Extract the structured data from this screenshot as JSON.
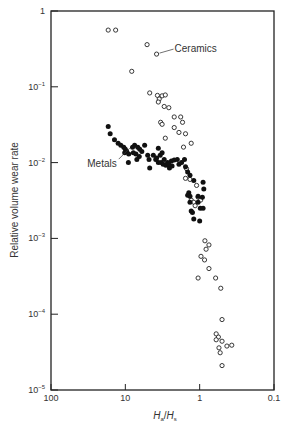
{
  "chart_data": {
    "type": "scatter",
    "title": "",
    "xlabel": "Ha/Hs",
    "xlabel_main": "H",
    "xlabel_sub_a": "a",
    "xlabel_sub_s": "s",
    "ylabel": "Relative volume wear rate",
    "xscale": "log",
    "yscale": "log",
    "x_reversed": true,
    "xlim": [
      100,
      0.1
    ],
    "ylim": [
      1e-05,
      1
    ],
    "grid": false,
    "legend": "none (direct annotations)",
    "x_ticks": [
      {
        "value": 100,
        "label": "100"
      },
      {
        "value": 10,
        "label": "10"
      },
      {
        "value": 1,
        "label": "1"
      },
      {
        "value": 0.1,
        "label": "0.1"
      }
    ],
    "y_ticks": [
      {
        "value": 1,
        "base": "1",
        "exp": ""
      },
      {
        "value": 0.1,
        "base": "10",
        "exp": "−1"
      },
      {
        "value": 0.01,
        "base": "10",
        "exp": "−2"
      },
      {
        "value": 0.001,
        "base": "10",
        "exp": "−3"
      },
      {
        "value": 0.0001,
        "base": "10",
        "exp": "−4"
      },
      {
        "value": 1e-05,
        "base": "10",
        "exp": "−5"
      }
    ],
    "annotations": [
      {
        "text": "Ceramics",
        "x": 3.8,
        "y": 0.27,
        "series": "Ceramics"
      },
      {
        "text": "Metals",
        "x": 9.0,
        "y": 0.016,
        "series": "Metals"
      }
    ],
    "series": [
      {
        "name": "Ceramics",
        "marker": "open-circle",
        "color": "#222222",
        "points": [
          [
            17.0,
            0.56
          ],
          [
            13.5,
            0.56
          ],
          [
            5.1,
            0.36
          ],
          [
            8.2,
            0.16
          ],
          [
            3.8,
            0.27
          ],
          [
            4.7,
            0.083
          ],
          [
            3.7,
            0.077
          ],
          [
            3.5,
            0.069
          ],
          [
            3.2,
            0.076
          ],
          [
            2.9,
            0.078
          ],
          [
            3.6,
            0.063
          ],
          [
            3.0,
            0.055
          ],
          [
            2.6,
            0.053
          ],
          [
            2.2,
            0.04
          ],
          [
            1.8,
            0.04
          ],
          [
            2.2,
            0.029
          ],
          [
            1.7,
            0.034
          ],
          [
            1.9,
            0.025
          ],
          [
            1.55,
            0.024
          ],
          [
            3.35,
            0.034
          ],
          [
            3.2,
            0.032
          ],
          [
            2.9,
            0.021
          ],
          [
            1.65,
            0.016
          ],
          [
            1.3,
            0.018
          ],
          [
            1.5,
            0.0083
          ],
          [
            1.55,
            0.0062
          ],
          [
            1.35,
            0.006
          ],
          [
            1.1,
            0.005
          ],
          [
            1.3,
            0.0032
          ],
          [
            1.2,
            0.003
          ],
          [
            1.15,
            0.0027
          ],
          [
            1.05,
            0.0035
          ],
          [
            0.97,
            0.0032
          ],
          [
            0.85,
            0.00093
          ],
          [
            0.75,
            0.00082
          ],
          [
            0.82,
            0.00072
          ],
          [
            0.96,
            0.00058
          ],
          [
            0.86,
            0.00052
          ],
          [
            0.75,
            0.0004
          ],
          [
            1.05,
            0.0003
          ],
          [
            0.61,
            0.0003
          ],
          [
            0.52,
            0.00022
          ],
          [
            0.5,
            8.5e-05
          ],
          [
            0.56,
            5e-05
          ],
          [
            0.6,
            5.5e-05
          ],
          [
            0.6,
            4.6e-05
          ],
          [
            0.5,
            4.4e-05
          ],
          [
            0.43,
            3.8e-05
          ],
          [
            0.37,
            3.9e-05
          ],
          [
            0.55,
            3.6e-05
          ],
          [
            0.53,
            3.1e-05
          ],
          [
            0.5,
            2.1e-05
          ]
        ]
      },
      {
        "name": "Metals",
        "marker": "filled-circle",
        "color": "#111111",
        "points": [
          [
            17.0,
            0.03
          ],
          [
            16.0,
            0.024
          ],
          [
            14.0,
            0.02
          ],
          [
            12.5,
            0.018
          ],
          [
            11.5,
            0.017
          ],
          [
            10.5,
            0.016
          ],
          [
            10.0,
            0.015
          ],
          [
            9.6,
            0.014
          ],
          [
            10.2,
            0.0135
          ],
          [
            9.0,
            0.013
          ],
          [
            7.2,
            0.013
          ],
          [
            6.0,
            0.014
          ],
          [
            5.0,
            0.0125
          ],
          [
            4.8,
            0.011
          ],
          [
            5.5,
            0.017
          ],
          [
            7.5,
            0.017
          ],
          [
            6.8,
            0.016
          ],
          [
            6.4,
            0.015
          ],
          [
            8.0,
            0.016
          ],
          [
            7.8,
            0.0135
          ],
          [
            6.5,
            0.012
          ],
          [
            7.0,
            0.011
          ],
          [
            9.1,
            0.01
          ],
          [
            4.2,
            0.0125
          ],
          [
            3.9,
            0.011
          ],
          [
            3.6,
            0.01
          ],
          [
            3.3,
            0.01
          ],
          [
            3.1,
            0.0095
          ],
          [
            3.8,
            0.0115
          ],
          [
            3.4,
            0.0125
          ],
          [
            3.0,
            0.011
          ],
          [
            2.7,
            0.01
          ],
          [
            2.4,
            0.0105
          ],
          [
            2.2,
            0.0108
          ],
          [
            2.0,
            0.011
          ],
          [
            3.6,
            0.0155
          ],
          [
            3.2,
            0.0135
          ],
          [
            4.7,
            0.0085
          ],
          [
            2.85,
            0.0092
          ],
          [
            2.35,
            0.009
          ],
          [
            2.55,
            0.0085
          ],
          [
            2.6,
            0.0095
          ],
          [
            1.9,
            0.0095
          ],
          [
            1.75,
            0.01
          ],
          [
            1.6,
            0.011
          ],
          [
            1.55,
            0.0088
          ],
          [
            1.45,
            0.0075
          ],
          [
            1.35,
            0.0068
          ],
          [
            1.2,
            0.0058
          ],
          [
            0.9,
            0.0055
          ],
          [
            0.88,
            0.0045
          ],
          [
            0.92,
            0.0035
          ],
          [
            1.05,
            0.0036
          ],
          [
            1.05,
            0.003
          ],
          [
            0.98,
            0.0025
          ],
          [
            0.9,
            0.0025
          ],
          [
            1.35,
            0.003
          ],
          [
            1.25,
            0.0022
          ],
          [
            1.3,
            0.0023
          ],
          [
            1.2,
            0.0018
          ],
          [
            1.0,
            0.0017
          ],
          [
            1.4,
            0.004
          ],
          [
            1.45,
            0.0037
          ],
          [
            1.35,
            0.0036
          ]
        ]
      }
    ]
  },
  "layout_px": {
    "plot_left": 51,
    "plot_right": 274,
    "plot_top": 11,
    "plot_bottom": 390
  }
}
